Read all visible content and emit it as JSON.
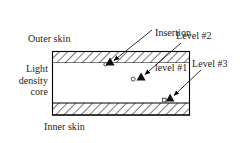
{
  "figure": {
    "background_color": "#ffffff",
    "line_color": "#000000",
    "text_color": "#1c1c1c",
    "panel": {
      "x": 52,
      "y": 51,
      "width": 138,
      "height": 65,
      "skin_thickness": 12,
      "hatch_angle_deg": 45,
      "core_fill": "#ffffff"
    },
    "labels": {
      "outer_skin": "Outer skin",
      "inner_skin": "Inner skin",
      "core_line1": "Light",
      "core_line2": "density",
      "core_line3": "core",
      "core_full": "Light density core",
      "insertion_level_1_line1": "Insertion",
      "insertion_level_1_line2": "level #1",
      "level_2": "Level #2",
      "level_3": "Level #3"
    },
    "markers": [
      {
        "id": "level-1",
        "label": "Insertion level #1",
        "triangle_x": 110,
        "triangle_y": 62,
        "circle_x": 105,
        "circle_y": 64,
        "circle_shape": "circle"
      },
      {
        "id": "level-2",
        "label": "Level #2",
        "triangle_x": 141,
        "triangle_y": 77,
        "circle_x": 133,
        "circle_y": 79,
        "circle_shape": "circle"
      },
      {
        "id": "level-3",
        "label": "Level #3",
        "triangle_x": 170,
        "triangle_y": 98,
        "circle_x": 164,
        "circle_y": 100,
        "circle_shape": "square"
      }
    ],
    "leaders": [
      {
        "id": "leader-1",
        "from_x": 152,
        "from_y": 30,
        "to_x": 112,
        "to_y": 61
      },
      {
        "id": "leader-2",
        "from_x": 180,
        "from_y": 44,
        "to_x": 143,
        "to_y": 75
      },
      {
        "id": "leader-3",
        "from_x": 200,
        "from_y": 71,
        "to_x": 172,
        "to_y": 96
      }
    ]
  }
}
